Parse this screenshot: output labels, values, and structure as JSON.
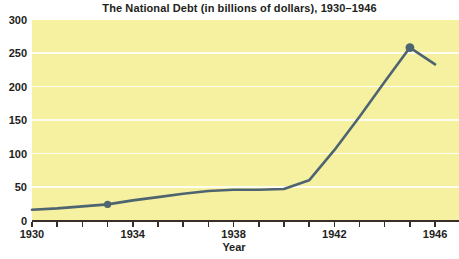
{
  "chart_data": {
    "type": "line",
    "title": "The National Debt (in billions of dollars), 1930–1946",
    "xlabel": "Year",
    "ylabel": "",
    "x": [
      1930,
      1931,
      1932,
      1933,
      1934,
      1935,
      1936,
      1937,
      1938,
      1939,
      1940,
      1941,
      1942,
      1943,
      1944,
      1945,
      1946
    ],
    "series": [
      {
        "name": "National debt (billions of dollars)",
        "values": [
          16,
          18,
          21,
          24,
          30,
          35,
          40,
          44,
          46,
          46,
          47,
          60,
          105,
          155,
          207,
          258,
          233
        ]
      }
    ],
    "markers": [
      {
        "x": 1933,
        "y": 24
      },
      {
        "x": 1945,
        "y": 258
      }
    ],
    "xlim": [
      1930,
      1946.95
    ],
    "ylim": [
      0,
      300
    ],
    "y_ticks": [
      0,
      50,
      100,
      150,
      200,
      250,
      300
    ],
    "x_ticks": [
      1930,
      1931,
      1932,
      1933,
      1934,
      1935,
      1936,
      1937,
      1938,
      1939,
      1940,
      1941,
      1942,
      1943,
      1944,
      1945,
      1946
    ],
    "x_tick_labels": [
      1930,
      1934,
      1938,
      1942,
      1946
    ],
    "grid": "horizontal",
    "legend": "none",
    "colors": {
      "page_background": "#ffffff",
      "plot_background": "#f5f1a1",
      "gridline": "#fdfdf2",
      "line": "#4e6470",
      "marker": "#4e6470",
      "axis": "#3a2e26",
      "text": "#221e1b"
    }
  }
}
